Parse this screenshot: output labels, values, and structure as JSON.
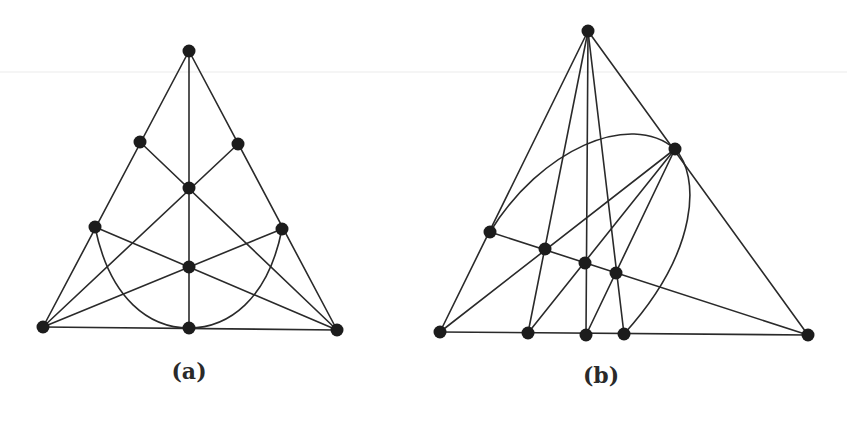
{
  "figures": [
    {
      "id": "a",
      "caption": "(a)",
      "caption_pos": [
        189,
        372
      ],
      "nodes": [
        {
          "id": "top",
          "x": 189,
          "y": 51
        },
        {
          "id": "upper-left",
          "x": 140,
          "y": 142
        },
        {
          "id": "upper-right",
          "x": 238,
          "y": 144
        },
        {
          "id": "center",
          "x": 189,
          "y": 188
        },
        {
          "id": "mid-left",
          "x": 95,
          "y": 227
        },
        {
          "id": "mid-right",
          "x": 282,
          "y": 229
        },
        {
          "id": "lower-center",
          "x": 189,
          "y": 267
        },
        {
          "id": "bottom-left",
          "x": 43,
          "y": 327
        },
        {
          "id": "bottom-mid",
          "x": 189,
          "y": 328
        },
        {
          "id": "bottom-right",
          "x": 337,
          "y": 330
        }
      ],
      "lines": [
        [
          "top",
          "bottom-left"
        ],
        [
          "top",
          "bottom-right"
        ],
        [
          "bottom-left",
          "bottom-right"
        ],
        [
          "top",
          "bottom-mid"
        ],
        [
          "bottom-left",
          "upper-right"
        ],
        [
          "bottom-right",
          "upper-left"
        ],
        [
          "bottom-left",
          "mid-right"
        ],
        [
          "bottom-right",
          "mid-left"
        ]
      ],
      "curves": [
        {
          "d": "M 95 227 C 110 300, 150 328, 189 328 C 228 328, 268 300, 282 229"
        }
      ]
    },
    {
      "id": "b",
      "caption": "(b)",
      "caption_pos": [
        601,
        376
      ],
      "nodes": [
        {
          "id": "top",
          "x": 588,
          "y": 31
        },
        {
          "id": "upper-right",
          "x": 675,
          "y": 149
        },
        {
          "id": "left",
          "x": 490,
          "y": 232
        },
        {
          "id": "inner-1",
          "x": 545,
          "y": 249
        },
        {
          "id": "inner-2",
          "x": 585,
          "y": 263
        },
        {
          "id": "inner-3",
          "x": 616,
          "y": 273
        },
        {
          "id": "bottom-left",
          "x": 440,
          "y": 332
        },
        {
          "id": "bottom-2",
          "x": 528,
          "y": 333
        },
        {
          "id": "bottom-3",
          "x": 586,
          "y": 335
        },
        {
          "id": "bottom-4",
          "x": 624,
          "y": 334
        },
        {
          "id": "bottom-right",
          "x": 808,
          "y": 335
        }
      ],
      "lines": [
        [
          "top",
          "bottom-left"
        ],
        [
          "top",
          "bottom-2"
        ],
        [
          "top",
          "bottom-3"
        ],
        [
          "top",
          "bottom-4"
        ],
        [
          "top",
          "bottom-right"
        ],
        [
          "bottom-left",
          "bottom-right"
        ],
        [
          "left",
          "bottom-right"
        ],
        [
          "upper-right",
          "bottom-left"
        ],
        [
          "upper-right",
          "bottom-2"
        ],
        [
          "upper-right",
          "bottom-3"
        ]
      ],
      "curves": [
        {
          "d": "M 490 232 C 540 150, 630 110, 675 149 C 700 175, 700 250, 624 334"
        }
      ]
    }
  ],
  "scan_line_y": 72
}
